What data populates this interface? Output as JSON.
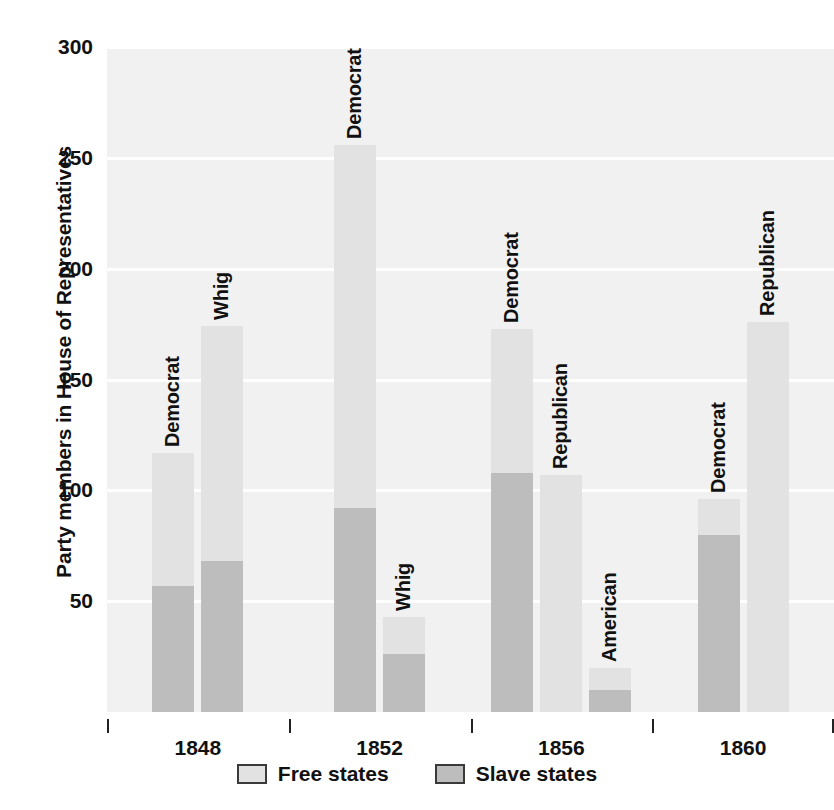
{
  "chart_data": {
    "type": "bar",
    "title": "",
    "subtitle": "",
    "xlabel": "",
    "ylabel": "Party members in House of Representatives",
    "ylim": [
      0,
      300
    ],
    "yticks": [
      50,
      100,
      150,
      200,
      250,
      300
    ],
    "grid": true,
    "stacked": true,
    "legend_position": "bottom",
    "categories": [
      "1848",
      "1852",
      "1856",
      "1860"
    ],
    "series": [
      {
        "name": "Free states",
        "color": "#e2e2e2"
      },
      {
        "name": "Slave states",
        "color": "#bdbdbd"
      }
    ],
    "groups": [
      {
        "category": "1848",
        "bars": [
          {
            "label": "Democrat",
            "slave_states": 57,
            "free_states": 60,
            "total": 117
          },
          {
            "label": "Whig",
            "slave_states": 68,
            "free_states": 106,
            "total": 174
          }
        ]
      },
      {
        "category": "1852",
        "bars": [
          {
            "label": "Democrat",
            "slave_states": 92,
            "free_states": 164,
            "total": 256
          },
          {
            "label": "Whig",
            "slave_states": 26,
            "free_states": 17,
            "total": 43
          }
        ]
      },
      {
        "category": "1856",
        "bars": [
          {
            "label": "Democrat",
            "slave_states": 108,
            "free_states": 65,
            "total": 173
          },
          {
            "label": "Republican",
            "slave_states": 0,
            "free_states": 107,
            "total": 107
          },
          {
            "label": "American",
            "slave_states": 10,
            "free_states": 10,
            "total": 20
          }
        ]
      },
      {
        "category": "1860",
        "bars": [
          {
            "label": "Democrat",
            "slave_states": 80,
            "free_states": 16,
            "total": 96
          },
          {
            "label": "Republican",
            "slave_states": 0,
            "free_states": 176,
            "total": 176
          }
        ]
      }
    ]
  },
  "axis": {
    "y_title": "Party members in House of Representatives",
    "y_tick_labels": [
      "300",
      "250",
      "200",
      "150",
      "100",
      "50"
    ],
    "x_tick_labels": [
      "1848",
      "1852",
      "1856",
      "1860"
    ]
  },
  "legend": {
    "items": [
      {
        "label": "Free states",
        "color": "#e2e2e2"
      },
      {
        "label": "Slave states",
        "color": "#bdbdbd"
      }
    ]
  },
  "colors": {
    "free_states": "#e2e2e2",
    "slave_states": "#bdbdbd",
    "plot_background": "#f1f1f1",
    "gridline": "#ffffff",
    "text": "#111111"
  }
}
